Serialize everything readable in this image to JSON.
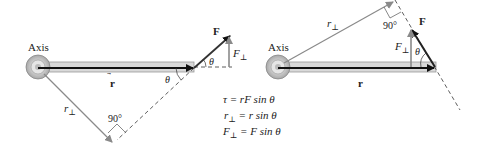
{
  "left_diagram": {
    "axis_label": "Axis",
    "r_label": "r",
    "r_perp_label": "r",
    "r_perp_sub": "⊥",
    "force_label": "F",
    "f_perp_label": "F",
    "f_perp_sub": "⊥",
    "theta_at_force": "θ",
    "theta_at_rod": "θ",
    "right_angle_label": "90°"
  },
  "right_diagram": {
    "axis_label": "Axis",
    "r_label": "r",
    "r_perp_label": "r",
    "r_perp_sub": "⊥",
    "force_label": "F",
    "f_perp_label": "F",
    "f_perp_sub": "⊥",
    "theta_label": "θ",
    "right_angle_label": "90°"
  },
  "equations": [
    {
      "lhs": "τ",
      "sub": "",
      "rhs": "= rF sin θ"
    },
    {
      "lhs": "r",
      "sub": "⊥",
      "rhs": "= r sin θ"
    },
    {
      "lhs": "F",
      "sub": "⊥",
      "rhs": "= F sin θ"
    }
  ],
  "colors": {
    "rod_fill": "#d9d9d9",
    "rod_edge": "#9a9a9a",
    "vector_dark": "#111111",
    "vector_gray": "#8a8a8a",
    "dashed": "#333333"
  }
}
